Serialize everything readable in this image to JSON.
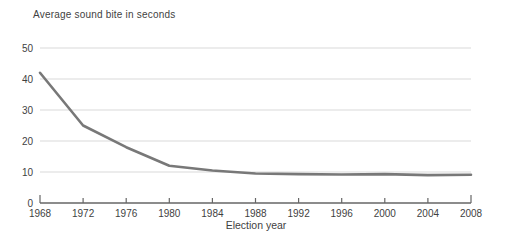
{
  "chart_data": {
    "type": "line",
    "title": "Average sound bite in seconds",
    "xlabel": "Election year",
    "ylabel": "",
    "x": [
      1968,
      1972,
      1976,
      1980,
      1984,
      1988,
      1992,
      1996,
      2000,
      2004,
      2008
    ],
    "values": [
      42,
      25,
      18,
      12,
      10.5,
      9.5,
      9.3,
      9.2,
      9.3,
      9.0,
      9.1
    ],
    "series_name": "Average sound bite length (seconds)",
    "ylim": [
      0,
      50
    ],
    "yticks": [
      0,
      10,
      20,
      30,
      40,
      50
    ],
    "xticks": [
      1968,
      1972,
      1976,
      1980,
      1984,
      1988,
      1992,
      1996,
      2000,
      2004,
      2008
    ],
    "grid": true,
    "legend": "none",
    "colors": {
      "line": "#787878",
      "grid": "#d9d9d9",
      "axis": "#666666",
      "text": "#3f3f3f",
      "background": "#ffffff"
    }
  }
}
